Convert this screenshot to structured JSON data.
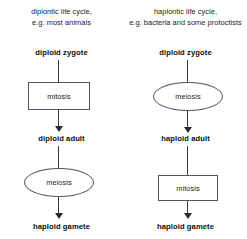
{
  "diagram": {
    "background_color": "#ffffff",
    "line_color": "#555555",
    "arrow_color": "#2b2b2b",
    "text_color": "#1a1a1a",
    "columns": [
      {
        "id": "diplontic",
        "header_line1": "diplontic life cycle,",
        "header_line2": "e.g. most animals",
        "start_label": "diploid zygote",
        "first_process": "mitosis",
        "first_process_shape": "rectangle",
        "middle_label": "diploid adult",
        "second_process": "meiosis",
        "second_process_shape": "ellipse",
        "end_label": "haploid gamete"
      },
      {
        "id": "haplontic",
        "header_line1": "haplontic life cycle,",
        "header_line2": "e.g. bacteria and some protoctists",
        "start_label": "diploid zygote",
        "first_process": "meiosis",
        "first_process_shape": "ellipse",
        "middle_label": "haploid adult",
        "second_process": "mitosis",
        "second_process_shape": "rectangle",
        "end_label": "haploid gamete"
      }
    ]
  }
}
